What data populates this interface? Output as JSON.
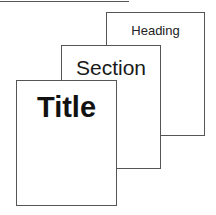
{
  "diagram": {
    "pages": [
      {
        "label": "Heading"
      },
      {
        "label": "Section"
      },
      {
        "label": "Title"
      }
    ],
    "line_color": "#555555"
  }
}
